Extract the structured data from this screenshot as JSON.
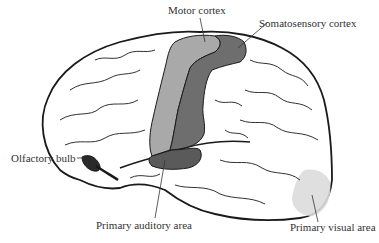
{
  "diagram": {
    "type": "labeled brain illustration (lateral view, left hemisphere)",
    "labels": [
      {
        "id": "motor-cortex",
        "text": "Motor cortex"
      },
      {
        "id": "somatosensory-cortex",
        "text": "Somatosensory cortex"
      },
      {
        "id": "olfactory-bulb",
        "text": "Olfactory bulb"
      },
      {
        "id": "primary-auditory-area",
        "text": "Primary auditory area"
      },
      {
        "id": "primary-visual-area",
        "text": "Primary visual area"
      }
    ],
    "colors": {
      "outline": "#1a1a1a",
      "motor_cortex": "#a9a9a9",
      "somatosensory_cortex": "#6e6e6e",
      "auditory_area": "#5a5a5a",
      "olfactory_bulb": "#2a2a2a",
      "visual_area": "#dcdcdc"
    }
  }
}
